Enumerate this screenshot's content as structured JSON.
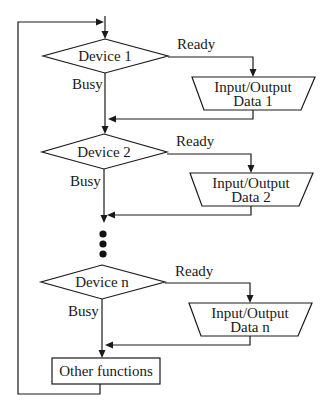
{
  "diagram": {
    "type": "flowchart",
    "devices": [
      {
        "decision_label": "Device 1",
        "ready_label": "Ready",
        "busy_label": "Busy",
        "io_line1": "Input/Output",
        "io_line2": "Data 1"
      },
      {
        "decision_label": "Device 2",
        "ready_label": "Ready",
        "busy_label": "Busy",
        "io_line1": "Input/Output",
        "io_line2": "Data 2"
      },
      {
        "decision_label": "Device n",
        "ready_label": "Ready",
        "busy_label": "Busy",
        "io_line1": "Input/Output",
        "io_line2": "Data n"
      }
    ],
    "ellipsis_dots": 3,
    "final_box_label": "Other functions",
    "colors": {
      "stroke": "#1a1a1a",
      "background": "#ffffff"
    }
  }
}
